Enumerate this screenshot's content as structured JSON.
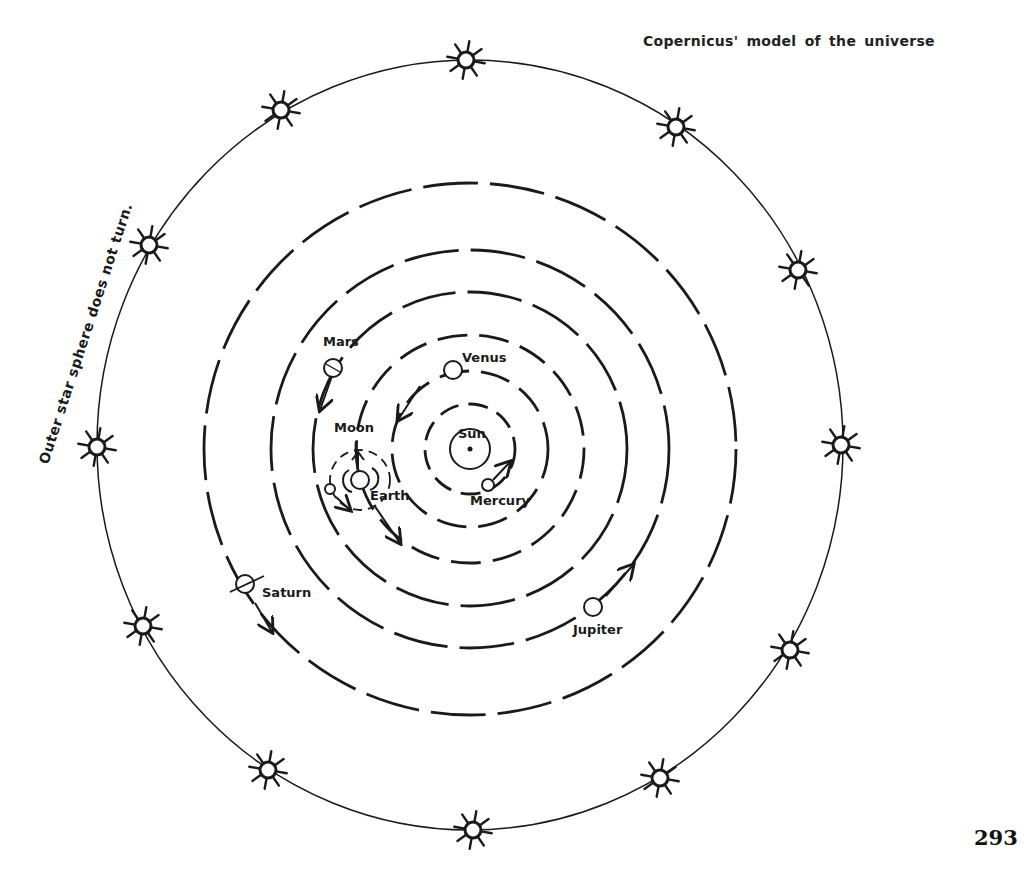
{
  "title": "Copernicus' model of the universe",
  "side_note": "Outer star sphere does not turn.",
  "page_number": "293",
  "colors": {
    "ink": "#1a1a1a",
    "background": "#ffffff"
  },
  "diagram": {
    "center": [
      470,
      449
    ],
    "outer_sphere": {
      "rx": 373,
      "ry": 385,
      "label": "Outer star sphere"
    },
    "stars": [
      [
        466,
        60
      ],
      [
        676,
        127
      ],
      [
        798,
        270
      ],
      [
        841,
        445
      ],
      [
        790,
        650
      ],
      [
        660,
        778
      ],
      [
        473,
        830
      ],
      [
        268,
        770
      ],
      [
        143,
        626
      ],
      [
        97,
        447
      ],
      [
        149,
        245
      ],
      [
        281,
        110
      ]
    ],
    "sun": {
      "label": "Sun",
      "pos": [
        470,
        449
      ]
    },
    "orbits": [
      {
        "name": "Mercury",
        "r": 45
      },
      {
        "name": "Venus",
        "r": 78
      },
      {
        "name": "Earth",
        "r": 114
      },
      {
        "name": "Mars",
        "r": 157
      },
      {
        "name": "Jupiter",
        "r": 199
      },
      {
        "name": "Saturn",
        "r": 266
      }
    ],
    "bodies": [
      {
        "name": "Mercury",
        "label": "Mercury",
        "pos": [
          488,
          485
        ],
        "label_pos": [
          470,
          505
        ]
      },
      {
        "name": "Venus",
        "label": "Venus",
        "pos": [
          453,
          370
        ],
        "label_pos": [
          462,
          362
        ]
      },
      {
        "name": "Earth",
        "label": "Earth",
        "pos": [
          360,
          480
        ],
        "label_pos": [
          370,
          500
        ]
      },
      {
        "name": "Moon",
        "label": "Moon",
        "pos": [
          330,
          489
        ],
        "label_pos": [
          334,
          432
        ]
      },
      {
        "name": "Mars",
        "label": "Mars",
        "pos": [
          333,
          368
        ],
        "label_pos": [
          323,
          346
        ]
      },
      {
        "name": "Jupiter",
        "label": "Jupiter",
        "pos": [
          593,
          607
        ],
        "label_pos": [
          573,
          634
        ]
      },
      {
        "name": "Saturn",
        "label": "Saturn",
        "pos": [
          245,
          584
        ],
        "label_pos": [
          262,
          597
        ]
      }
    ]
  }
}
